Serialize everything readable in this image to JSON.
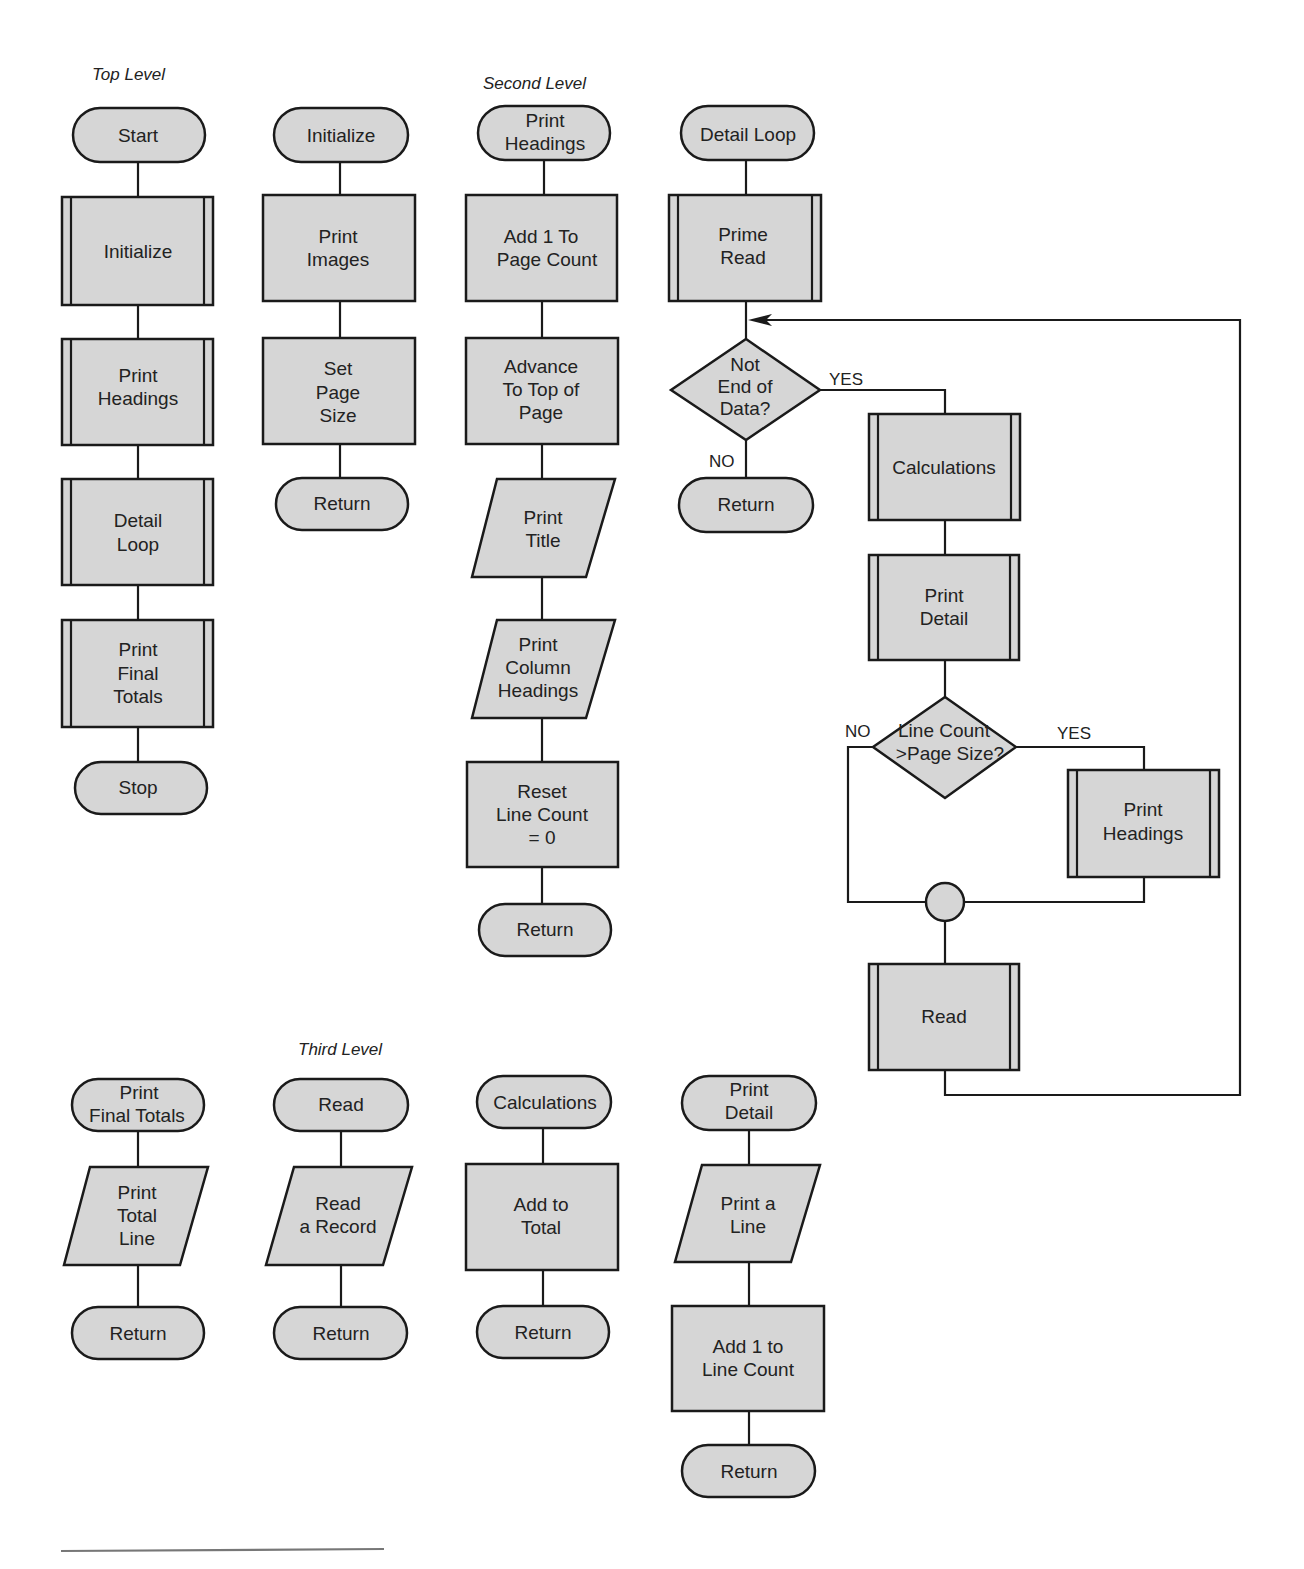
{
  "sections": {
    "top": "Top Level",
    "second": "Second Level",
    "third": "Third Level"
  },
  "top_level": {
    "start": "Start",
    "initialize": "Initialize",
    "print_headings": [
      "Print",
      "Headings"
    ],
    "detail_loop": [
      "Detail",
      "Loop"
    ],
    "print_final_totals": [
      "Print",
      "Final",
      "Totals"
    ],
    "stop": "Stop"
  },
  "initialize_module": {
    "terminal": "Initialize",
    "print_images": [
      "Print",
      "Images"
    ],
    "set_page_size": [
      "Set",
      "Page",
      "Size"
    ],
    "return": "Return"
  },
  "print_headings_module": {
    "terminal": [
      "Print",
      "Headings"
    ],
    "add_page_count": [
      "Add 1 To",
      "Page Count"
    ],
    "advance": [
      "Advance",
      "To Top of",
      "Page"
    ],
    "print_title": [
      "Print",
      "Title"
    ],
    "print_column_headings": [
      "Print",
      "Column",
      "Headings"
    ],
    "reset_line_count": [
      "Reset",
      "Line Count",
      "= 0"
    ],
    "return": "Return"
  },
  "detail_loop_module": {
    "terminal": "Detail Loop",
    "prime_read": [
      "Prime",
      "Read"
    ],
    "decision_eod": [
      "Not",
      "End of",
      "Data?"
    ],
    "yes": "YES",
    "no": "NO",
    "return": "Return",
    "calculations": "Calculations",
    "print_detail": [
      "Print",
      "Detail"
    ],
    "decision_page": [
      "Line Count",
      ">Page Size?"
    ],
    "yes2": "YES",
    "no2": "NO",
    "print_headings": [
      "Print",
      "Headings"
    ],
    "read": "Read"
  },
  "third_level": {
    "print_final_totals": {
      "terminal": [
        "Print",
        "Final Totals"
      ],
      "print_total_line": [
        "Print",
        "Total",
        "Line"
      ],
      "return": "Return"
    },
    "read": {
      "terminal": "Read",
      "read_record": [
        "Read",
        "a Record"
      ],
      "return": "Return"
    },
    "calculations": {
      "terminal": "Calculations",
      "add_to_total": [
        "Add to",
        "Total"
      ],
      "return": "Return"
    },
    "print_detail": {
      "terminal": [
        "Print",
        "Detail"
      ],
      "print_a_line": [
        "Print a",
        "Line"
      ],
      "add_line_count": [
        "Add 1 to",
        "Line Count"
      ],
      "return": "Return"
    }
  }
}
